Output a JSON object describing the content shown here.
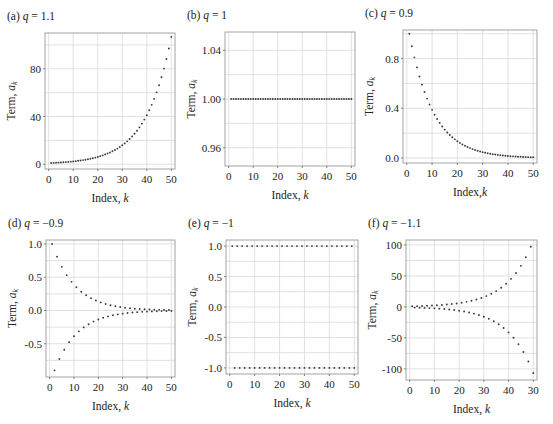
{
  "figure": {
    "series_note": "Point values are generated from a_k = q^(k-1), k = 1..50, using the q values printed in the panel titles; they reproduce the plotted shape but were not measured point-by-point from the image.",
    "panels": [
      {
        "id": "a",
        "label": "(a)",
        "q_text": "1.1",
        "q": 1.1,
        "frame": {
          "x0": 45,
          "y0": 33,
          "x1": 175,
          "y1": 169
        },
        "xlim": [
          -1.5,
          51.5
        ],
        "ylim": [
          -4,
          110
        ],
        "xticks": [
          0,
          10,
          20,
          30,
          40,
          50
        ],
        "xtick_labels": [
          "0",
          "10",
          "20",
          "30",
          "40",
          "50"
        ],
        "yticks": [
          0,
          40,
          80
        ],
        "ytick_labels": [
          "0",
          "40",
          "80"
        ],
        "ygrid": [
          0,
          20,
          40,
          60,
          80,
          100
        ],
        "xlabel": "Index, ",
        "xlabel_var": "k",
        "ylabel": "Term, ",
        "ylabel_var": "a",
        "ylabel_sub": "k"
      },
      {
        "id": "b",
        "label": "(b)",
        "q_text": "1",
        "q": 1,
        "frame": {
          "x0": 225,
          "y0": 32,
          "x1": 355,
          "y1": 166
        },
        "xlim": [
          -1.5,
          51.5
        ],
        "ylim": [
          0.945,
          1.055
        ],
        "xticks": [
          0,
          10,
          20,
          30,
          40,
          50
        ],
        "xtick_labels": [
          "0",
          "10",
          "20",
          "30",
          "40",
          "50"
        ],
        "yticks": [
          0.96,
          1.0,
          1.04
        ],
        "ytick_labels": [
          "0.96",
          "1.00",
          "1.04"
        ],
        "ygrid": [
          0.96,
          0.98,
          1.0,
          1.02,
          1.04
        ],
        "xlabel": "Index, ",
        "xlabel_var": "k",
        "ylabel": "Term, ",
        "ylabel_var": "a",
        "ylabel_sub": "k"
      },
      {
        "id": "c",
        "label": "(c)",
        "q_text": "0.9",
        "q": 0.9,
        "frame": {
          "x0": 403,
          "y0": 30,
          "x1": 537,
          "y1": 163
        },
        "xlim": [
          -1.5,
          51.5
        ],
        "ylim": [
          -0.04,
          1.03
        ],
        "xticks": [
          0,
          10,
          20,
          30,
          40,
          50
        ],
        "xtick_labels": [
          "0",
          "10",
          "20",
          "30",
          "40",
          "50"
        ],
        "yticks": [
          0.0,
          0.4,
          0.8
        ],
        "ytick_labels": [
          "0.0",
          "0.4",
          "0.8"
        ],
        "ygrid": [
          0.0,
          0.2,
          0.4,
          0.6,
          0.8,
          1.0
        ],
        "xlabel": "Index,",
        "xlabel_var": "k",
        "ylabel": "Term, ",
        "ylabel_var": "a",
        "ylabel_sub": "k"
      },
      {
        "id": "d",
        "label": "(d)",
        "q_text": "−0.9",
        "q": -0.9,
        "frame": {
          "x0": 46,
          "y0": 240,
          "x1": 175,
          "y1": 377
        },
        "xlim": [
          -1.5,
          51.5
        ],
        "ylim": [
          -1.0,
          1.06
        ],
        "xticks": [
          0,
          10,
          20,
          30,
          40,
          50
        ],
        "xtick_labels": [
          "0",
          "10",
          "20",
          "30",
          "40",
          "50"
        ],
        "yticks": [
          -0.5,
          0.0,
          0.5,
          1.0
        ],
        "ytick_labels": [
          "-0.5",
          "0.0",
          "0.5",
          "1.0"
        ],
        "ygrid": [
          -0.75,
          -0.5,
          -0.25,
          0.0,
          0.25,
          0.5,
          0.75,
          1.0
        ],
        "xlabel": "Index, ",
        "xlabel_var": "k",
        "ylabel": "Term, ",
        "ylabel_var": "a",
        "ylabel_sub": "k"
      },
      {
        "id": "e",
        "label": "(e)",
        "q_text": "−1",
        "q": -1,
        "frame": {
          "x0": 226,
          "y0": 240,
          "x1": 358,
          "y1": 374
        },
        "xlim": [
          -1.5,
          51.5
        ],
        "ylim": [
          -1.1,
          1.1
        ],
        "xticks": [
          0,
          10,
          20,
          30,
          40,
          50
        ],
        "xtick_labels": [
          "0",
          "10",
          "20",
          "30",
          "40",
          "50"
        ],
        "yticks": [
          -1.0,
          -0.5,
          0.0,
          0.5,
          1.0
        ],
        "ytick_labels": [
          "-1.0",
          "-0.5",
          "0.0",
          "0.5",
          "1.0"
        ],
        "ygrid": [
          -1.0,
          -0.75,
          -0.5,
          -0.25,
          0.0,
          0.25,
          0.5,
          0.75,
          1.0
        ],
        "xlabel": "Index, ",
        "xlabel_var": "k",
        "ylabel": "Term, ",
        "ylabel_var": "a",
        "ylabel_sub": "k"
      },
      {
        "id": "f",
        "label": "(f)",
        "q_text": "−1.1",
        "q": -1.1,
        "frame": {
          "x0": 406,
          "y0": 240,
          "x1": 537,
          "y1": 380
        },
        "xlim": [
          -1.5,
          51.5
        ],
        "ylim": [
          -118,
          108
        ],
        "xticks": [
          0,
          10,
          20,
          30,
          40,
          50
        ],
        "xtick_labels": [
          "0",
          "10",
          "20",
          "30",
          "40",
          "30"
        ],
        "yticks": [
          -100,
          -50,
          0,
          50,
          100
        ],
        "ytick_labels": [
          "-100",
          "-50",
          "0",
          "50",
          "100"
        ],
        "ygrid": [
          -100,
          -75,
          -50,
          -25,
          0,
          25,
          50,
          75,
          100
        ],
        "xlabel": "Index, ",
        "xlabel_var": "k",
        "ylabel": "Term, ",
        "ylabel_var": "a",
        "ylabel_sub": "k"
      }
    ]
  },
  "chart_data": [
    {
      "type": "scatter",
      "title": "(a) q = 1.1",
      "xlabel": "Index, k",
      "ylabel": "Term, a_k",
      "xlim": [
        0,
        50
      ],
      "ylim": [
        0,
        110
      ],
      "grid": true,
      "legend": null,
      "series": [
        {
          "name": "a_k = 1.1^(k-1)",
          "x_range": [
            1,
            50
          ],
          "formula": "1.1^(k-1)",
          "values": [
            1.0,
            1.1,
            1.21,
            1.331,
            1.464,
            1.611,
            1.772,
            1.949,
            2.144,
            2.358,
            2.594,
            2.853,
            3.138,
            3.452,
            3.797,
            4.177,
            4.595,
            5.054,
            5.56,
            6.116,
            6.727,
            7.4,
            8.14,
            8.954,
            9.85,
            10.835,
            11.918,
            13.11,
            14.421,
            15.863,
            17.449,
            19.194,
            21.114,
            23.225,
            25.548,
            28.102,
            30.913,
            34.004,
            37.404,
            41.145,
            45.259,
            49.785,
            54.764,
            60.24,
            66.264,
            72.89,
            80.18,
            88.197,
            97.017,
            106.719
          ]
        }
      ]
    },
    {
      "type": "scatter",
      "title": "(b) q = 1",
      "xlabel": "Index, k",
      "ylabel": "Term, a_k",
      "xlim": [
        0,
        50
      ],
      "ylim": [
        0.95,
        1.05
      ],
      "grid": true,
      "legend": null,
      "series": [
        {
          "name": "a_k = 1",
          "x_range": [
            1,
            50
          ],
          "formula": "1^(k-1)",
          "constant_value": 1.0
        }
      ]
    },
    {
      "type": "scatter",
      "title": "(c) q = 0.9",
      "xlabel": "Index, k",
      "ylabel": "Term, a_k",
      "xlim": [
        0,
        50
      ],
      "ylim": [
        0,
        1.0
      ],
      "grid": true,
      "legend": null,
      "series": [
        {
          "name": "a_k = 0.9^(k-1)",
          "x_range": [
            1,
            50
          ],
          "formula": "0.9^(k-1)",
          "values": [
            1.0,
            0.9,
            0.81,
            0.729,
            0.656,
            0.59,
            0.531,
            0.478,
            0.43,
            0.387,
            0.349,
            0.314,
            0.282,
            0.254,
            0.229,
            0.206,
            0.185,
            0.167,
            0.15,
            0.135,
            0.122,
            0.109,
            0.098,
            0.089,
            0.08,
            0.072,
            0.065,
            0.058,
            0.052,
            0.047,
            0.042,
            0.038,
            0.034,
            0.031,
            0.028,
            0.025,
            0.023,
            0.02,
            0.018,
            0.016,
            0.015,
            0.013,
            0.012,
            0.011,
            0.01,
            0.009,
            0.008,
            0.007,
            0.006,
            0.006
          ]
        }
      ]
    },
    {
      "type": "scatter",
      "title": "(d) q = -0.9",
      "xlabel": "Index, k",
      "ylabel": "Term, a_k",
      "xlim": [
        0,
        50
      ],
      "ylim": [
        -1.0,
        1.0
      ],
      "grid": true,
      "legend": null,
      "series": [
        {
          "name": "a_k = (-0.9)^(k-1)",
          "x_range": [
            1,
            50
          ],
          "formula": "(-0.9)^(k-1)"
        }
      ]
    },
    {
      "type": "scatter",
      "title": "(e) q = -1",
      "xlabel": "Index, k",
      "ylabel": "Term, a_k",
      "xlim": [
        0,
        50
      ],
      "ylim": [
        -1.0,
        1.0
      ],
      "grid": true,
      "legend": null,
      "series": [
        {
          "name": "a_k = (-1)^(k-1)",
          "x_range": [
            1,
            50
          ],
          "formula": "(-1)^(k-1)",
          "alternates_between": [
            1,
            -1
          ]
        }
      ]
    },
    {
      "type": "scatter",
      "title": "(f) q = -1.1",
      "xlabel": "Index, k",
      "ylabel": "Term, a_k",
      "xlim": [
        0,
        50
      ],
      "ylim": [
        -110,
        100
      ],
      "grid": true,
      "legend": null,
      "series": [
        {
          "name": "a_k = (-1.1)^(k-1)",
          "x_range": [
            1,
            50
          ],
          "formula": "(-1.1)^(k-1)"
        }
      ]
    }
  ]
}
